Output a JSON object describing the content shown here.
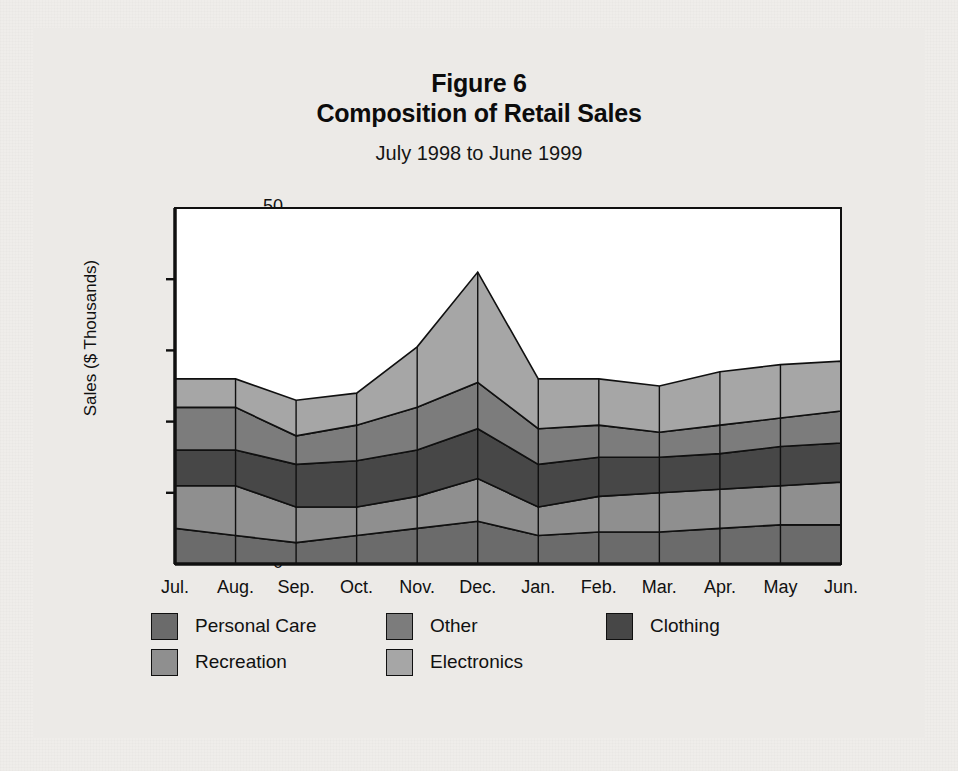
{
  "figure": {
    "number_label": "Figure 6",
    "title": "Composition of Retail Sales",
    "subtitle": "July 1998  to June 1999"
  },
  "chart_data": {
    "type": "area",
    "stacked": true,
    "title": "Composition of Retail Sales",
    "subtitle": "July 1998  to June 1999",
    "figure_label": "Figure 6",
    "xlabel": "",
    "ylabel": "Sales ($ Thousands)",
    "ylim": [
      0,
      50
    ],
    "yticks": [
      0,
      10,
      20,
      30,
      40,
      50
    ],
    "ytick_labels": [
      "0",
      "10",
      "20",
      "30",
      "40",
      "50"
    ],
    "grid": false,
    "legend_position": "bottom",
    "categories": [
      "Jul.",
      "Aug.",
      "Sep.",
      "Oct.",
      "Nov.",
      "Dec.",
      "Jan.",
      "Feb.",
      "Mar.",
      "Apr.",
      "May",
      "Jun."
    ],
    "series": [
      {
        "name": "Personal Care",
        "color": "#6b6b6b",
        "stack_order": 1,
        "values": [
          5.0,
          4.0,
          3.0,
          4.0,
          5.0,
          6.0,
          4.0,
          4.5,
          4.5,
          5.0,
          5.5,
          5.5
        ]
      },
      {
        "name": "Recreation",
        "color": "#8f8f8f",
        "stack_order": 2,
        "values": [
          6.0,
          7.0,
          5.0,
          4.0,
          4.5,
          6.0,
          4.0,
          5.0,
          5.5,
          5.5,
          5.5,
          6.0
        ]
      },
      {
        "name": "Clothing",
        "color": "#474747",
        "stack_order": 3,
        "values": [
          5.0,
          5.0,
          6.0,
          6.5,
          6.5,
          7.0,
          6.0,
          5.5,
          5.0,
          5.0,
          5.5,
          5.5
        ]
      },
      {
        "name": "Other",
        "color": "#7c7c7c",
        "stack_order": 4,
        "values": [
          6.0,
          6.0,
          4.0,
          5.0,
          6.0,
          6.5,
          5.0,
          4.5,
          3.5,
          4.0,
          4.0,
          4.5
        ]
      },
      {
        "name": "Electronics",
        "color": "#a6a6a6",
        "stack_order": 5,
        "values": [
          4.0,
          4.0,
          5.0,
          4.5,
          8.5,
          15.5,
          7.0,
          6.5,
          6.5,
          7.5,
          7.5,
          7.0
        ]
      }
    ],
    "cumulative_tops": {
      "Personal Care": [
        5.0,
        4.0,
        3.0,
        4.0,
        5.0,
        6.0,
        4.0,
        4.5,
        4.5,
        5.0,
        5.5,
        5.5
      ],
      "Recreation": [
        11.0,
        11.0,
        8.0,
        8.0,
        9.5,
        12.0,
        8.0,
        9.5,
        10.0,
        10.5,
        11.0,
        11.5
      ],
      "Clothing": [
        16.0,
        16.0,
        14.0,
        14.5,
        16.0,
        19.0,
        14.0,
        15.0,
        15.0,
        15.5,
        16.5,
        17.0
      ],
      "Other": [
        22.0,
        22.0,
        18.0,
        19.5,
        22.0,
        25.5,
        19.0,
        19.5,
        18.5,
        19.5,
        20.5,
        21.5
      ],
      "Electronics": [
        26.0,
        26.0,
        23.0,
        24.0,
        30.5,
        41.0,
        26.0,
        26.0,
        25.0,
        27.0,
        28.0,
        28.5
      ]
    },
    "totals": [
      26.0,
      26.0,
      23.0,
      24.0,
      30.5,
      41.0,
      26.0,
      26.0,
      25.0,
      27.0,
      28.0,
      28.5
    ]
  },
  "legend": {
    "rows": [
      [
        {
          "label": "Personal Care",
          "color": "#6b6b6b"
        },
        {
          "label": "Other",
          "color": "#7c7c7c"
        },
        {
          "label": "Clothing",
          "color": "#474747"
        }
      ],
      [
        {
          "label": "Recreation",
          "color": "#8f8f8f"
        },
        {
          "label": "Electronics",
          "color": "#a6a6a6"
        }
      ]
    ]
  },
  "axes": {
    "y_axis_label": "Sales ($ Thousands)"
  }
}
